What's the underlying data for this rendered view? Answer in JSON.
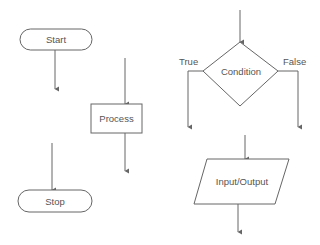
{
  "diagram": {
    "type": "flowchart-symbols",
    "colors": {
      "stroke": "#666666",
      "text": "#555555",
      "background": "#ffffff"
    },
    "nodes": [
      {
        "id": "start",
        "shape": "terminator",
        "label": "Start"
      },
      {
        "id": "process",
        "shape": "rectangle",
        "label": "Process"
      },
      {
        "id": "stop",
        "shape": "terminator",
        "label": "Stop"
      },
      {
        "id": "condition",
        "shape": "diamond",
        "label": "Condition"
      },
      {
        "id": "io",
        "shape": "parallelogram",
        "label": "Input/Output"
      }
    ],
    "branch_labels": {
      "true": "True",
      "false": "False"
    }
  }
}
